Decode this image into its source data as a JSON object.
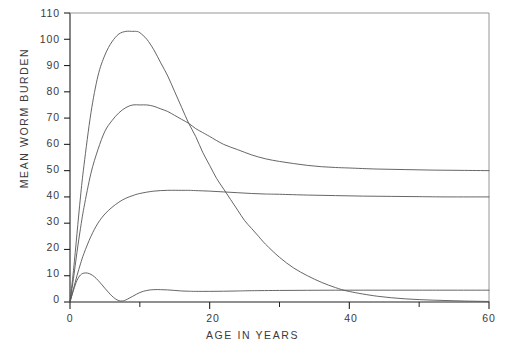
{
  "chart_data": {
    "type": "line",
    "title": "",
    "xlabel": "AGE IN YEARS",
    "ylabel": "MEAN WORM BURDEN",
    "xlim": [
      0,
      60
    ],
    "ylim": [
      0,
      110
    ],
    "grid": false,
    "legend": "none",
    "x_major_ticks": [
      0,
      20,
      40,
      60
    ],
    "x_minor_ticks": [
      10,
      30,
      50
    ],
    "y_ticks": [
      0,
      10,
      20,
      30,
      40,
      50,
      60,
      70,
      80,
      90,
      100,
      110
    ],
    "x_tick_labels": [
      "0",
      "20",
      "40",
      "60"
    ],
    "y_tick_labels": [
      "0",
      "10",
      "20",
      "30",
      "40",
      "50",
      "60",
      "70",
      "80",
      "90",
      "100",
      "110"
    ],
    "line_color": "#555555",
    "axis_color": "#222222",
    "series": [
      {
        "name": "curve-1",
        "peak": {
          "x": 9.5,
          "y": 103
        },
        "asymptote": 0,
        "x": [
          0,
          0.5,
          1,
          1.5,
          2,
          3,
          4,
          5,
          6,
          7,
          8,
          9,
          9.5,
          10,
          11,
          12,
          13,
          14,
          15,
          16,
          17,
          18,
          19,
          20,
          21,
          22,
          23,
          24,
          25,
          26,
          27,
          28,
          30,
          32,
          34,
          36,
          38,
          40,
          44,
          48,
          52,
          56,
          60
        ],
        "y": [
          0,
          12,
          26,
          40,
          52,
          72,
          86,
          94,
          99,
          102,
          103,
          103,
          103,
          102.5,
          100,
          96,
          91,
          86,
          80,
          74,
          68,
          63,
          57,
          52,
          47,
          43,
          39,
          35,
          31,
          28,
          25,
          22,
          17,
          13,
          10,
          7.5,
          5.5,
          4,
          2.2,
          1.2,
          0.7,
          0.4,
          0.2
        ]
      },
      {
        "name": "curve-2",
        "peak": {
          "x": 11,
          "y": 75
        },
        "asymptote": 50,
        "x": [
          0,
          0.5,
          1,
          1.5,
          2,
          3,
          4,
          5,
          6,
          7,
          8,
          9,
          10,
          11,
          12,
          13,
          14,
          15,
          16,
          17,
          18,
          19,
          20,
          22,
          24,
          26,
          28,
          30,
          32,
          34,
          36,
          38,
          40,
          44,
          48,
          52,
          56,
          60
        ],
        "y": [
          0,
          9,
          19,
          28,
          36,
          49,
          58,
          65,
          69,
          72,
          74,
          75,
          75,
          75,
          74.5,
          73.5,
          72.5,
          71,
          69.5,
          68,
          66,
          64.5,
          63,
          60,
          58,
          56,
          54.5,
          53.5,
          52.7,
          52,
          51.5,
          51.2,
          51,
          50.6,
          50.4,
          50.2,
          50.1,
          50
        ]
      },
      {
        "name": "curve-3",
        "peak": {
          "x": 17,
          "y": 42.5
        },
        "asymptote": 40,
        "x": [
          0,
          0.5,
          1,
          1.5,
          2,
          3,
          4,
          5,
          6,
          7,
          8,
          9,
          10,
          12,
          14,
          16,
          17,
          18,
          20,
          22,
          24,
          26,
          28,
          30,
          34,
          38,
          42,
          46,
          50,
          54,
          60
        ],
        "y": [
          0,
          5,
          10,
          14.5,
          18.5,
          25,
          30,
          33.5,
          36,
          38,
          39.5,
          40.5,
          41.3,
          42.2,
          42.5,
          42.5,
          42.5,
          42.4,
          42.2,
          41.9,
          41.6,
          41.3,
          41.1,
          41,
          40.7,
          40.5,
          40.3,
          40.2,
          40.1,
          40,
          40
        ]
      },
      {
        "name": "curve-4",
        "peak": {
          "x": 2.5,
          "y": 11
        },
        "second_peak": {
          "x": 12,
          "y": 4.7
        },
        "trough": {
          "x": 7,
          "y": 0.4
        },
        "asymptote": 4.5,
        "x": [
          0,
          0.5,
          1,
          1.5,
          2,
          2.5,
          3,
          3.5,
          4,
          4.5,
          5,
          5.5,
          6,
          6.5,
          7,
          7.5,
          8,
          9,
          10,
          11,
          12,
          13,
          14,
          15,
          16,
          17,
          18,
          20,
          22,
          24,
          26,
          30,
          34,
          38,
          42,
          46,
          50,
          54,
          60
        ],
        "y": [
          0,
          4.5,
          8.2,
          10.3,
          11,
          11,
          10.5,
          9.6,
          8.3,
          6.8,
          5.2,
          3.7,
          2.3,
          1.2,
          0.5,
          0.4,
          0.8,
          2.2,
          3.6,
          4.4,
          4.7,
          4.7,
          4.6,
          4.4,
          4.2,
          4.1,
          4.05,
          4.05,
          4.1,
          4.2,
          4.3,
          4.4,
          4.45,
          4.5,
          4.5,
          4.5,
          4.5,
          4.5,
          4.5
        ]
      }
    ]
  },
  "axes": {
    "x_title": "AGE IN YEARS",
    "y_title": "MEAN WORM BURDEN"
  }
}
